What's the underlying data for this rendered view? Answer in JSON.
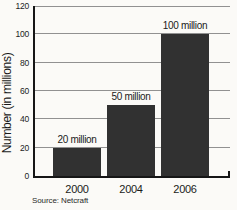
{
  "chart_data": {
    "type": "bar",
    "title": "",
    "xlabel": "",
    "ylabel": "Number (in millions)",
    "categories": [
      "2000",
      "2004",
      "2006"
    ],
    "values": [
      20,
      50,
      100
    ],
    "bar_labels": [
      "20 million",
      "50 million",
      "100 million"
    ],
    "ylim": [
      0,
      120
    ],
    "yticks": [
      0,
      20,
      40,
      60,
      80,
      100,
      120
    ],
    "grid": true,
    "legend": false,
    "source": "Source: Netcraft",
    "bar_color": "#313131",
    "gridline_color": "#919191",
    "axis_color": "#161616",
    "background_color": "#fbfaf7"
  }
}
